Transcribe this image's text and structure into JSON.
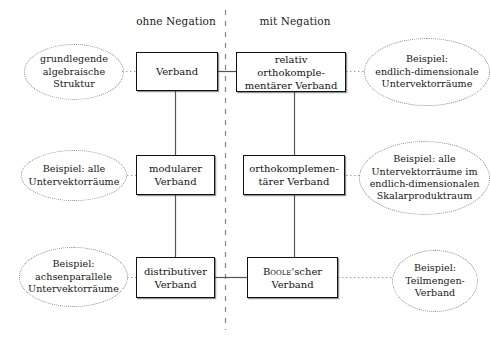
{
  "figure": {
    "columns": [
      {
        "id": "ohne",
        "label": "ohne Negation"
      },
      {
        "id": "mit",
        "label": "mit Negation"
      }
    ],
    "divider": {
      "style": "dashed",
      "orientation": "vertical"
    },
    "nodes": [
      {
        "id": "verband",
        "label": "Verband",
        "column": "ohne",
        "row": 1
      },
      {
        "id": "relativ-ortho",
        "label": "relativ orthokomple-\nmentärer Verband",
        "column": "mit",
        "row": 1
      },
      {
        "id": "modularer",
        "label": "modularer\nVerband",
        "column": "ohne",
        "row": 2
      },
      {
        "id": "orthokomplementaer",
        "label": "orthokomplemen-\ntärer Verband",
        "column": "mit",
        "row": 2
      },
      {
        "id": "distributiver",
        "label": "distributiver\nVerband",
        "column": "ohne",
        "row": 3
      },
      {
        "id": "boolescher",
        "label": "Boole'scher\nVerband",
        "column": "mit",
        "row": 3,
        "smallcaps_prefix": "Boole"
      }
    ],
    "node_labels": {
      "verband_l1": "Verband",
      "relativ_l1": "relativ orthokomple-",
      "relativ_l2": "mentärer Verband",
      "modularer_l1": "modularer",
      "modularer_l2": "Verband",
      "ortho_l1": "orthokomplemen-",
      "ortho_l2": "tärer Verband",
      "distributiver_l1": "distributiver",
      "distributiver_l2": "Verband",
      "boole_l1a": "Boole",
      "boole_l1b": "'scher",
      "boole_l2": "Verband"
    },
    "notes": [
      {
        "id": "note-grundlegende",
        "target": "verband",
        "side": "left",
        "lines": [
          "grundlegende",
          "algebraische",
          "Struktur"
        ]
      },
      {
        "id": "note-endlich-dim",
        "target": "relativ-ortho",
        "side": "right",
        "lines": [
          "Beispiel:",
          "endlich-dimensionale",
          "Untervektorräume"
        ]
      },
      {
        "id": "note-alle-uvr",
        "target": "modularer",
        "side": "left",
        "lines": [
          "Beispiel: alle",
          "Untervektorräume"
        ]
      },
      {
        "id": "note-skalarprodukt",
        "target": "orthokomplementaer",
        "side": "right",
        "lines": [
          "Beispiel: alle",
          "Untervektorräume im",
          "endlich-dimensionalen",
          "Skalarproduktraum"
        ]
      },
      {
        "id": "note-achsenparallel",
        "target": "distributiver",
        "side": "left",
        "lines": [
          "Beispiel:",
          "achsenparallele",
          "Untervektorräume"
        ]
      },
      {
        "id": "note-teilmengen",
        "target": "boolescher",
        "side": "right",
        "lines": [
          "Beispiel:",
          "Teilmengen-",
          "Verband"
        ]
      }
    ],
    "note_labels": {
      "grundlegende_l1": "grundlegende",
      "grundlegende_l2": "algebraische",
      "grundlegende_l3": "Struktur",
      "endlich_l1": "Beispiel:",
      "endlich_l2": "endlich-dimensionale",
      "endlich_l3": "Untervektorräume",
      "alle_l1": "Beispiel: alle",
      "alle_l2": "Untervektorräume",
      "skalar_l1": "Beispiel: alle",
      "skalar_l2": "Untervektorräume im",
      "skalar_l3": "endlich-dimensionalen",
      "skalar_l4": "Skalarproduktraum",
      "achsen_l1": "Beispiel:",
      "achsen_l2": "achsenparallele",
      "achsen_l3": "Untervektorräume",
      "teilmengen_l1": "Beispiel:",
      "teilmengen_l2": "Teilmengen-",
      "teilmengen_l3": "Verband"
    },
    "edges": [
      {
        "from": "verband",
        "to": "relativ-ortho",
        "kind": "solid"
      },
      {
        "from": "verband",
        "to": "modularer",
        "kind": "solid"
      },
      {
        "from": "modularer",
        "to": "distributiver",
        "kind": "solid"
      },
      {
        "from": "relativ-ortho",
        "to": "orthokomplementaer",
        "kind": "solid"
      },
      {
        "from": "orthokomplementaer",
        "to": "boolescher",
        "kind": "solid"
      },
      {
        "from": "distributiver",
        "to": "boolescher",
        "kind": "solid"
      }
    ],
    "colors": {
      "box_border": "#111111",
      "box_fill": "#ffffff",
      "note_border": "#8a8a8a",
      "edge": "#555555",
      "divider": "#8a8a8a",
      "text": "#1a1a1a",
      "background": "#ffffff"
    }
  }
}
